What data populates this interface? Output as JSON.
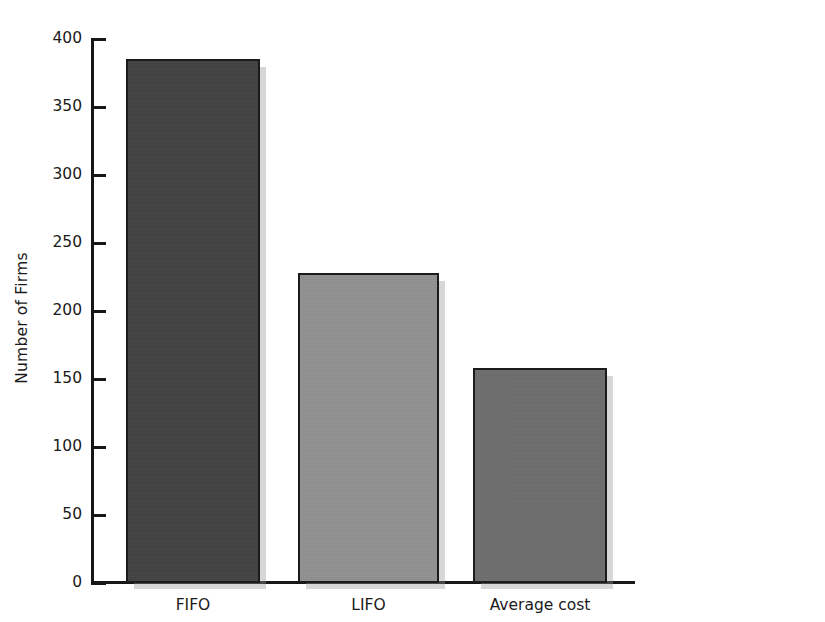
{
  "chart_data": {
    "type": "bar",
    "title": "",
    "subtitle": "",
    "xlabel": "",
    "ylabel": "Number of Firms",
    "categories": [
      "FIFO",
      "LIFO",
      "Average cost"
    ],
    "values": [
      385,
      228,
      158
    ],
    "series": [
      {
        "name": "Number of Firms",
        "values": [
          385,
          228,
          158
        ]
      }
    ],
    "ylim": [
      0,
      400
    ],
    "ytick_labels": [
      "400",
      "350",
      "300",
      "250",
      "200",
      "150",
      "100",
      "50",
      "0"
    ],
    "ytick_values": [
      400,
      350,
      300,
      250,
      200,
      150,
      100,
      50,
      0
    ],
    "ytick_step": 50,
    "grid": false,
    "legend": false,
    "legend_position": "none",
    "annotations": [],
    "bar_colors": [
      "#424242",
      "#919191",
      "#6e6e6e"
    ],
    "bar_border_color": "#1b1b1b",
    "axis_color": "#171717",
    "background_color": "#ffffff"
  },
  "axes": {
    "y_title": "Number of Firms",
    "ticks": [
      {
        "label": "400",
        "value": 400
      },
      {
        "label": "350",
        "value": 350
      },
      {
        "label": "300",
        "value": 300
      },
      {
        "label": "250",
        "value": 250
      },
      {
        "label": "200",
        "value": 200
      },
      {
        "label": "150",
        "value": 150
      },
      {
        "label": "100",
        "value": 100
      },
      {
        "label": "50",
        "value": 50
      },
      {
        "label": "0",
        "value": 0
      }
    ]
  },
  "bars": [
    {
      "label": "FIFO",
      "value": 385,
      "color": "#424242"
    },
    {
      "label": "LIFO",
      "value": 228,
      "color": "#919191"
    },
    {
      "label": "Average cost",
      "value": 158,
      "color": "#6e6e6e"
    }
  ]
}
